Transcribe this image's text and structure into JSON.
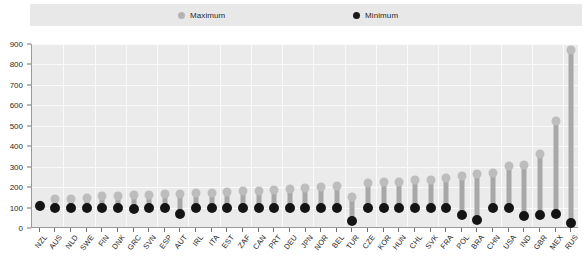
{
  "legend": {
    "entries": [
      {
        "label": "Maximum",
        "icon": "circle-marker-icon",
        "color": "#bdbdbd"
      },
      {
        "label": "Minimum",
        "icon": "circle-marker-icon",
        "color": "#141414"
      }
    ]
  },
  "axes": {
    "y_ticks": [
      "0",
      "100",
      "200",
      "300",
      "400",
      "500",
      "600",
      "700",
      "800",
      "900"
    ]
  },
  "colors": {
    "plot_background": "#ebebeb",
    "gridline": "#fafafa",
    "legend_band": "#e8e8e8",
    "maximum_marker": "#bdbdbd",
    "minimum_marker": "#141414",
    "stem": "#a8a8a8",
    "axis_line": "#9a9a9a"
  },
  "chart_data": {
    "type": "scatter",
    "title": "",
    "subtitle": "",
    "xlabel": "",
    "ylabel": "",
    "ylim": [
      0,
      900
    ],
    "ytick_step": 100,
    "grid": true,
    "legend_position": "top",
    "categories": [
      "NZL",
      "AUS",
      "NLD",
      "SWE",
      "FIN",
      "DNK",
      "GRC",
      "SVN",
      "ESP",
      "AUT",
      "IRL",
      "ITA",
      "EST",
      "ZAF",
      "CAN",
      "PRT",
      "DEU",
      "JPN",
      "NOR",
      "BEL",
      "TUR",
      "CZE",
      "KOR",
      "HUN",
      "CHL",
      "SVK",
      "FRA",
      "POL",
      "BRA",
      "CHN",
      "USA",
      "IND",
      "GBR",
      "MEX",
      "RUS"
    ],
    "series": [
      {
        "name": "Maximum",
        "values": [
          110,
          135,
          138,
          140,
          150,
          152,
          155,
          158,
          160,
          162,
          165,
          168,
          172,
          175,
          178,
          182,
          185,
          190,
          195,
          200,
          145,
          215,
          220,
          222,
          228,
          232,
          238,
          250,
          260,
          265,
          300,
          305,
          355,
          520,
          865
        ]
      },
      {
        "name": "Minimum",
        "values": [
          105,
          95,
          92,
          92,
          92,
          92,
          90,
          92,
          92,
          65,
          92,
          92,
          92,
          92,
          92,
          92,
          92,
          92,
          92,
          92,
          28,
          92,
          92,
          92,
          92,
          92,
          92,
          60,
          32,
          92,
          92,
          55,
          60,
          62,
          22
        ]
      }
    ]
  }
}
